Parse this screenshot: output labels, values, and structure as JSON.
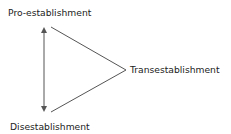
{
  "diagram": {
    "nodes": {
      "top": {
        "label": "Pro-establishment"
      },
      "bottom": {
        "label": "Disestablishment"
      },
      "right": {
        "label": "Transestablishment"
      }
    },
    "edges": [
      {
        "from": "top",
        "to": "bottom",
        "style": "double-arrow"
      },
      {
        "from": "top",
        "to": "right",
        "style": "line"
      },
      {
        "from": "right",
        "to": "bottom",
        "style": "line"
      }
    ],
    "colors": {
      "line": "#555555",
      "text": "#222222"
    }
  }
}
